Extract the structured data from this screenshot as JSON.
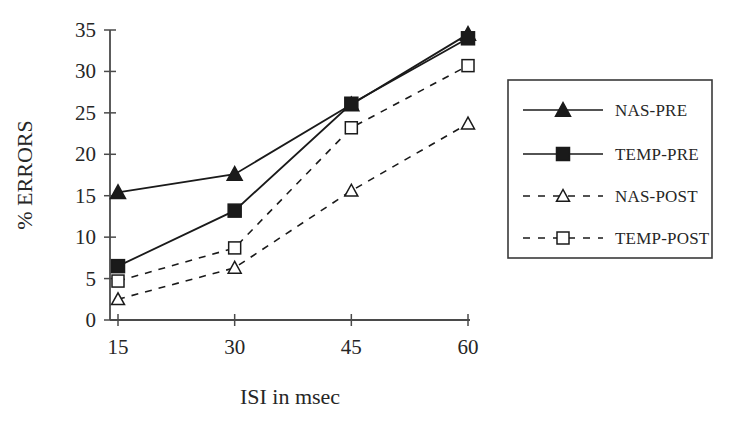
{
  "chart_data": {
    "type": "line",
    "title": "",
    "xlabel": "ISI in msec",
    "ylabel": "% ERRORS",
    "x": [
      15,
      30,
      45,
      60
    ],
    "categories": [
      "15",
      "30",
      "45",
      "60"
    ],
    "xtick_labels": [
      "15",
      "30",
      "45",
      "60"
    ],
    "ytick_labels": [
      "0",
      "5",
      "10",
      "15",
      "20",
      "25",
      "30",
      "35"
    ],
    "yticks": [
      0,
      5,
      10,
      15,
      20,
      25,
      30,
      35
    ],
    "xlim": [
      15,
      60
    ],
    "ylim": [
      0,
      35
    ],
    "grid": false,
    "legend_position": "right",
    "series": [
      {
        "name": "NAS-PRE",
        "values": [
          15.4,
          17.6,
          26.0,
          34.5
        ],
        "marker": "filled-triangle",
        "linestyle": "solid",
        "color": "#1a1a1a"
      },
      {
        "name": "TEMP-PRE",
        "values": [
          6.5,
          13.2,
          26.1,
          34.0
        ],
        "marker": "filled-square",
        "linestyle": "solid",
        "color": "#1a1a1a"
      },
      {
        "name": "NAS-POST",
        "values": [
          2.5,
          6.3,
          15.6,
          23.7
        ],
        "marker": "open-triangle",
        "linestyle": "dashed",
        "color": "#1a1a1a"
      },
      {
        "name": "TEMP-POST",
        "values": [
          4.7,
          8.7,
          23.2,
          30.7
        ],
        "marker": "open-square",
        "linestyle": "dashed",
        "color": "#1a1a1a"
      }
    ]
  },
  "legend": {
    "items": [
      {
        "label": "NAS-PRE"
      },
      {
        "label": "TEMP-PRE"
      },
      {
        "label": "NAS-POST"
      },
      {
        "label": "TEMP-POST"
      }
    ]
  },
  "axes": {
    "y_title": "% ERRORS",
    "x_title": "ISI in msec"
  },
  "colors": {
    "ink": "#1a1a1a",
    "axis": "#4a4a4a",
    "background": "#ffffff"
  }
}
